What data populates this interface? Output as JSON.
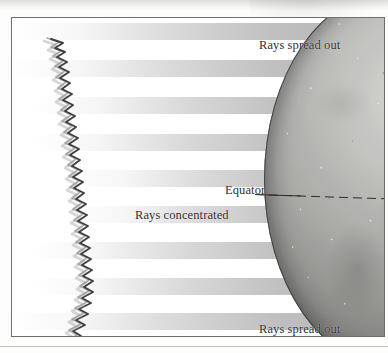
{
  "figure": {
    "labels": {
      "top_rays": "Rays spread out",
      "bottom_rays": "Rays spread out",
      "equator": "Equator",
      "concentrated": "Rays concentrated"
    },
    "colors": {
      "frame_border": "#6e6e6e",
      "text": "#2f2f2f",
      "ray_band": "#a8a8a8",
      "globe_light": "#d9d9d6",
      "globe_dark": "#4f4f4d",
      "equator_line": "#2b2b2b",
      "sun_edge": "#6a6a6a",
      "page_background": "#ffffff"
    },
    "ray_bands": [
      {
        "top": 5,
        "left_class": "wide"
      },
      {
        "top": 42,
        "left_class": "wide"
      },
      {
        "top": 79,
        "left_class": "mid"
      },
      {
        "top": 116,
        "left_class": "mid"
      },
      {
        "top": 152,
        "left_class": "short"
      },
      {
        "top": 188,
        "left_class": "short"
      },
      {
        "top": 224,
        "left_class": "mid"
      },
      {
        "top": 260,
        "left_class": "mid"
      },
      {
        "top": 295,
        "left_class": "wide"
      }
    ]
  }
}
